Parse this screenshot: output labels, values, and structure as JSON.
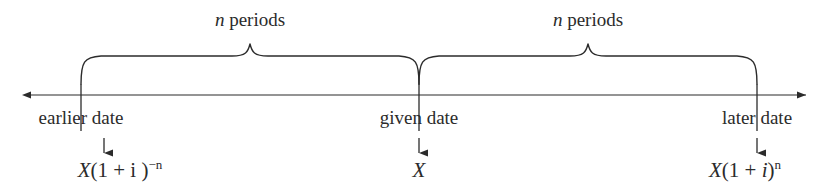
{
  "figure": {
    "type": "timeline-diagram",
    "background_color": "#ffffff",
    "stroke_color": "#2b2b2b",
    "text_color": "#2b2b2b"
  },
  "braces": [
    {
      "caption_var": "n",
      "caption_word": "periods",
      "center_x": 250,
      "from_x": 81,
      "to_x": 419
    },
    {
      "caption_var": "n",
      "caption_word": "periods",
      "center_x": 588,
      "from_x": 419,
      "to_x": 757
    }
  ],
  "axis": {
    "name": "timeline-axis",
    "y": 95,
    "start_x": 22,
    "end_x": 815,
    "double_headed": true
  },
  "ticks": [
    {
      "label": "earlier date",
      "x": 81
    },
    {
      "label": "given date",
      "x": 419
    },
    {
      "label": "later date",
      "x": 757
    }
  ],
  "formulas": [
    {
      "name": "present-value-formula",
      "x": 120,
      "parts": [
        {
          "text": "X",
          "style": "italic"
        },
        {
          "text": "(1 + ",
          "style": "upright"
        },
        {
          "text": "i",
          "style": "upright"
        },
        {
          "text": " )",
          "style": "upright"
        }
      ],
      "exponent": "−n"
    },
    {
      "name": "given-value-formula",
      "x": 419,
      "parts": [
        {
          "text": "X",
          "style": "italic"
        }
      ],
      "exponent": ""
    },
    {
      "name": "future-value-formula",
      "x": 745,
      "parts": [
        {
          "text": "X",
          "style": "italic"
        },
        {
          "text": "(1 + ",
          "style": "upright"
        },
        {
          "text": "i",
          "style": "italic"
        },
        {
          "text": ")",
          "style": "upright"
        }
      ],
      "exponent": "n"
    }
  ],
  "down_arrows": [
    {
      "name": "down-arrow-earlier",
      "x": 104,
      "top_y": 138,
      "bottom_y": 157
    },
    {
      "name": "down-arrow-given",
      "x": 419,
      "top_y": 138,
      "bottom_y": 157
    },
    {
      "name": "down-arrow-later",
      "x": 757,
      "top_y": 138,
      "bottom_y": 157
    }
  ]
}
